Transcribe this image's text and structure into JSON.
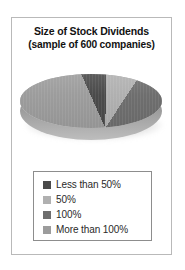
{
  "figure": {
    "title_line1": "Size of Stock Dividends",
    "title_line2": "(sample of 600 companies)",
    "frame_border_color": "#b9b9b9",
    "background_color": "#ffffff"
  },
  "legend": {
    "border_color": "#8d8d8d",
    "items": [
      {
        "label": "Less than 50%",
        "color": "#4a4a4a"
      },
      {
        "label": "50%",
        "color": "#b0b0b0"
      },
      {
        "label": "100%",
        "color": "#6e6e6e"
      },
      {
        "label": "More than 100%",
        "color": "#9c9c9c"
      }
    ]
  },
  "chart_data": {
    "type": "pie",
    "title": "Size of Stock Dividends (sample of 600 companies)",
    "sample_size": 600,
    "three_d": true,
    "legend_position": "bottom",
    "categories": [
      "Less than 50%",
      "50%",
      "100%",
      "More than 100%"
    ],
    "values": [
      7,
      9,
      60,
      24
    ],
    "units": "percent",
    "colors": [
      "#4a4a4a",
      "#b0b0b0",
      "#6e6e6e",
      "#9c9c9c"
    ],
    "labels_shown": false
  }
}
